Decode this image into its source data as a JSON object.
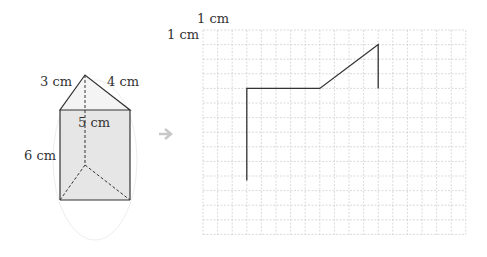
{
  "prism": {
    "edge_left": "3 cm",
    "edge_right": "4 cm",
    "edge_front": "5 cm",
    "height": "6 cm"
  },
  "grid": {
    "unit_x_label": "1 cm",
    "unit_y_label": "1 cm",
    "cols": 18,
    "rows": 14,
    "cell_px": 14.6
  },
  "net_path": {
    "points_cells": [
      [
        3,
        10.3
      ],
      [
        3,
        4
      ],
      [
        8,
        4
      ],
      [
        12,
        1
      ],
      [
        12,
        4
      ]
    ]
  },
  "colors": {
    "grid": "#d0d0d0",
    "face": "#e8e8e8",
    "line": "#333333",
    "arrow": "#c8c8c8"
  }
}
